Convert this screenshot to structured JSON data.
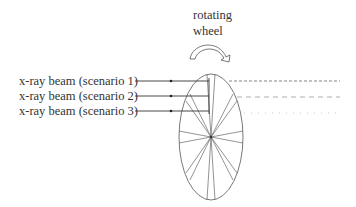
{
  "title": {
    "line1": "rotating",
    "line2": "wheel"
  },
  "beams": [
    {
      "label": "x-ray beam (scenario 1)",
      "y": 81,
      "exit_style": "dashed"
    },
    {
      "label": "x-ray beam (scenario 2)",
      "y": 96,
      "exit_style": "long-dash"
    },
    {
      "label": "x-ray beam (scenario 3)",
      "y": 111,
      "exit_style": "dotted"
    }
  ],
  "colors": {
    "line": "#333333",
    "wheel": "#555555",
    "dash1": "#666666",
    "dash2": "#999999",
    "dash3": "#bbbbbb"
  }
}
